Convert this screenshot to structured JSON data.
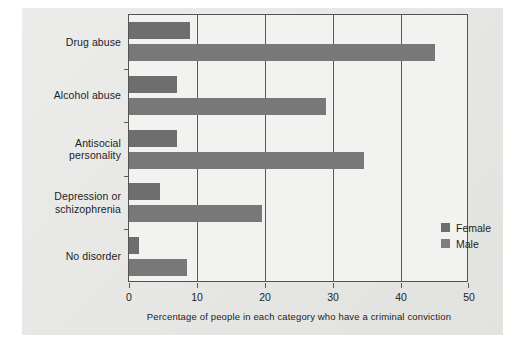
{
  "chart_data": {
    "type": "bar",
    "orientation": "horizontal",
    "title": "",
    "xlabel": "Percentage of people in each category who have a criminal conviction",
    "ylabel": "",
    "xlim": [
      0,
      50
    ],
    "xticks": [
      0,
      10,
      20,
      30,
      40,
      50
    ],
    "xtick_labels": [
      "0",
      "10",
      "20",
      "30",
      "40",
      "50"
    ],
    "grid": true,
    "grid_axis": "x",
    "legend_position": "lower-right",
    "categories": [
      "Drug abuse",
      "Alcohol abuse",
      "Antisocial personality",
      "Depression or schizophrenia",
      "No disorder"
    ],
    "category_label_lines": [
      [
        "Drug abuse"
      ],
      [
        "Alcohol abuse"
      ],
      [
        "Antisocial",
        "personality"
      ],
      [
        "Depression or",
        "schizophrenia"
      ],
      [
        "No disorder"
      ]
    ],
    "series": [
      {
        "name": "Female",
        "color": "#6e6e6e",
        "values": [
          9,
          7,
          7,
          4.5,
          1.5
        ]
      },
      {
        "name": "Male",
        "color": "#787878",
        "values": [
          45,
          29,
          34.5,
          19.5,
          8.5
        ]
      }
    ]
  },
  "legend": {
    "entries": [
      {
        "label": "Female",
        "swatch": "#6e6e6e"
      },
      {
        "label": "Male",
        "swatch": "#7e7e7e"
      }
    ]
  },
  "colors": {
    "page_background": "#ffffff",
    "panel_background": "#e9e9e7",
    "plot_background": "#f2f2f0",
    "axis": "#555550",
    "text": "#1d1d1d"
  }
}
